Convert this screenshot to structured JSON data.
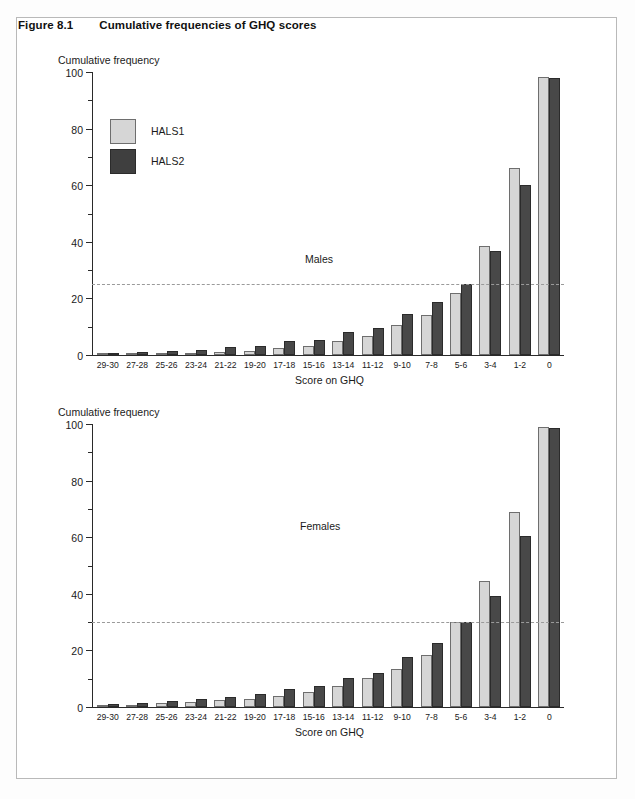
{
  "figure": {
    "number": "Figure 8.1",
    "title": "Cumulative frequencies of GHQ scores"
  },
  "legend": {
    "series1": "HALS1",
    "series2": "HALS2"
  },
  "colors": {
    "series1": "#d6d6d6",
    "series2": "#484848",
    "axis": "#2a2a2a",
    "reference_line": "#9a9a9a"
  },
  "axis": {
    "y_title": "Cumulative frequency",
    "x_title": "Score on GHQ",
    "y_ticks": [
      "100",
      "80",
      "60",
      "40",
      "20",
      "0"
    ]
  },
  "panels": [
    {
      "note": "Males"
    },
    {
      "note": "Females"
    }
  ],
  "chart_data": [
    {
      "type": "bar",
      "title": "Cumulative frequencies of GHQ scores",
      "subtitle": "Males",
      "xlabel": "Score on GHQ",
      "ylabel": "Cumulative frequency",
      "ylim": [
        0,
        100
      ],
      "ytick_values": [
        0,
        20,
        40,
        60,
        80,
        100
      ],
      "yminor_step": 10,
      "grid": false,
      "legend_position": "upper-left",
      "reference_line": 25,
      "categories": [
        "29-30",
        "27-28",
        "25-26",
        "23-24",
        "21-22",
        "19-20",
        "17-18",
        "15-16",
        "13-14",
        "11-12",
        "9-10",
        "7-8",
        "5-6",
        "3-4",
        "1-2",
        "0"
      ],
      "series": [
        {
          "name": "HALS1",
          "values": [
            0.3,
            0.5,
            0.8,
            0.7,
            1.1,
            1.3,
            2.6,
            3.3,
            5.1,
            6.8,
            10.8,
            14.2,
            22.0,
            38.8,
            66.4,
            98.5
          ]
        },
        {
          "name": "HALS2",
          "values": [
            0.7,
            1.1,
            1.4,
            1.8,
            2.8,
            3.1,
            5.0,
            5.4,
            8.3,
            9.5,
            14.5,
            18.9,
            25.3,
            36.8,
            60.3,
            98.3
          ]
        }
      ]
    },
    {
      "type": "bar",
      "title": "Cumulative frequencies of GHQ scores",
      "subtitle": "Females",
      "xlabel": "Score on GHQ",
      "ylabel": "Cumulative frequency",
      "ylim": [
        0,
        100
      ],
      "ytick_values": [
        0,
        20,
        40,
        60,
        80,
        100
      ],
      "yminor_step": 10,
      "grid": false,
      "legend_position": "none",
      "reference_line": 30,
      "categories": [
        "29-30",
        "27-28",
        "25-26",
        "23-24",
        "21-22",
        "19-20",
        "17-18",
        "15-16",
        "13-14",
        "11-12",
        "9-10",
        "7-8",
        "5-6",
        "3-4",
        "1-2",
        "0"
      ],
      "series": [
        {
          "name": "HALS1",
          "values": [
            0.6,
            0.8,
            1.3,
            1.8,
            2.4,
            2.7,
            3.9,
            5.3,
            7.4,
            10.2,
            13.5,
            18.6,
            30.1,
            44.8,
            69.2,
            99.3
          ]
        },
        {
          "name": "HALS2",
          "values": [
            1.2,
            1.4,
            2.1,
            2.9,
            3.7,
            4.5,
            6.4,
            7.6,
            10.4,
            12.2,
            17.6,
            22.7,
            30.2,
            39.4,
            60.8,
            99.0
          ]
        }
      ]
    }
  ]
}
